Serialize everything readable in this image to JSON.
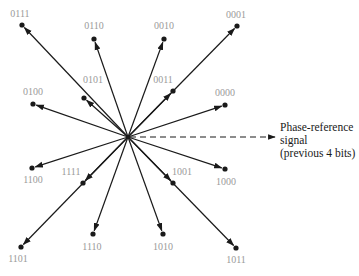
{
  "diagram": {
    "center": {
      "x": 128,
      "y": 137
    },
    "colors": {
      "line": "#1a1a1a",
      "label": "#9a9a9a",
      "text": "#1a1a1a"
    },
    "points": [
      {
        "label": "0111",
        "x": 22,
        "y": 25,
        "lx": 20,
        "ly": 17
      },
      {
        "label": "0110",
        "x": 94,
        "y": 39,
        "lx": 94,
        "ly": 29
      },
      {
        "label": "0010",
        "x": 164,
        "y": 39,
        "lx": 164,
        "ly": 29
      },
      {
        "label": "0001",
        "x": 237,
        "y": 26,
        "lx": 236,
        "ly": 18
      },
      {
        "label": "0101",
        "x": 84,
        "y": 98,
        "lx": 93,
        "ly": 83
      },
      {
        "label": "0011",
        "x": 173,
        "y": 91,
        "lx": 163,
        "ly": 83
      },
      {
        "label": "0100",
        "x": 33,
        "y": 104,
        "lx": 33,
        "ly": 95
      },
      {
        "label": "0000",
        "x": 225,
        "y": 105,
        "lx": 225,
        "ly": 96
      },
      {
        "label": "1100",
        "x": 32,
        "y": 168,
        "lx": 33,
        "ly": 183
      },
      {
        "label": "1111",
        "x": 83,
        "y": 183,
        "lx": 71,
        "ly": 175
      },
      {
        "label": "1001",
        "x": 173,
        "y": 183,
        "lx": 182,
        "ly": 175
      },
      {
        "label": "1000",
        "x": 225,
        "y": 169,
        "lx": 226,
        "ly": 185
      },
      {
        "label": "1101",
        "x": 21,
        "y": 247,
        "lx": 18,
        "ly": 262
      },
      {
        "label": "1110",
        "x": 93,
        "y": 234,
        "lx": 92,
        "ly": 250
      },
      {
        "label": "1010",
        "x": 163,
        "y": 234,
        "lx": 163,
        "ly": 250
      },
      {
        "label": "1011",
        "x": 236,
        "y": 248,
        "lx": 236,
        "ly": 263
      }
    ],
    "reference": {
      "x_end": 275,
      "y": 137,
      "lines": [
        "Phase-reference",
        "signal",
        "(previous 4 bits)"
      ],
      "text_x": 280,
      "text_y": [
        131,
        144,
        157
      ]
    }
  }
}
